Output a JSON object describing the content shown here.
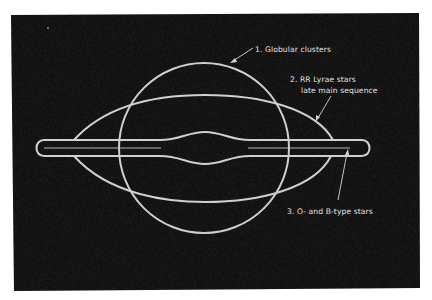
{
  "diagram": {
    "background_color": "#050505",
    "page_color": "#ffffff",
    "line_color": "#cfcfcf",
    "components": [
      {
        "id": 1,
        "shape": "circle",
        "label": "1. Globular clusters"
      },
      {
        "id": 2,
        "shape": "spindle-ellipse",
        "label_line1": "2. RR Lyrae stars",
        "label_line2": "late main sequence"
      },
      {
        "id": 3,
        "shape": "thin-disk-with-central-bulge",
        "label": "3. O- and B-type stars"
      }
    ]
  },
  "labels": {
    "globular": "1. Globular clusters",
    "rrlyrae_line1": "2. RR Lyrae stars",
    "rrlyrae_line2": "late main sequence",
    "obstars": "3. O- and B-type stars"
  }
}
